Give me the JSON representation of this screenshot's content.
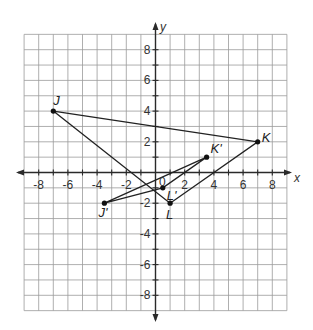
{
  "diagram": {
    "type": "coordinate-plane",
    "x_axis_label": "x",
    "y_axis_label": "y",
    "origin_label": "0",
    "grid_range": {
      "x": [
        -9,
        9
      ],
      "y": [
        -9,
        9
      ]
    },
    "x_tick_labels": [
      "-8",
      "-6",
      "-4",
      "-2",
      "2",
      "4",
      "6",
      "8"
    ],
    "y_tick_labels": [
      "8",
      "6",
      "4",
      "2",
      "-2",
      "-4",
      "-6",
      "-8"
    ],
    "triangles": [
      {
        "name": "JKL",
        "vertices": [
          {
            "label": "J",
            "x": -7,
            "y": 4
          },
          {
            "label": "K",
            "x": 7,
            "y": 2
          },
          {
            "label": "L",
            "x": 1,
            "y": -2
          }
        ]
      },
      {
        "name": "J'K'L'",
        "vertices": [
          {
            "label": "J'",
            "x": -3.5,
            "y": -2
          },
          {
            "label": "K'",
            "x": 3.5,
            "y": 1
          },
          {
            "label": "L'",
            "x": 0.5,
            "y": -1
          }
        ]
      }
    ],
    "colors": {
      "grid": "#9a9a9a",
      "axis": "#2a2a2a",
      "lines": "#222222"
    }
  }
}
